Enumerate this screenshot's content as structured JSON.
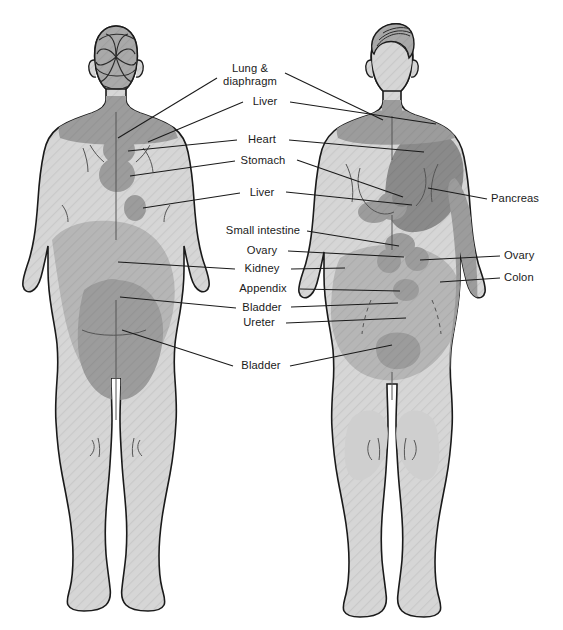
{
  "figure": {
    "views": [
      {
        "name": "posterior",
        "caption": "Posterior (back) view"
      },
      {
        "name": "anterior",
        "caption": "Anterior (front) view"
      }
    ],
    "colors": {
      "background": "#ffffff",
      "body_fill": "#d6d6d6",
      "body_outline": "#1a1a1a",
      "zone_mid": "#b3b3b3",
      "zone_dark": "#9a9a9a",
      "zone_darkest": "#868686",
      "hair_fill": "#a8a8a8",
      "label_text": "#1a1a1a",
      "leader_line": "#1a1a1a"
    }
  },
  "labels": {
    "center_column": [
      {
        "id": "lung-diaphragm",
        "text_line1": "Lung &",
        "text_line2": "diaphragm",
        "x": 250,
        "y": 68,
        "align": "center"
      },
      {
        "id": "liver-upper",
        "text": "Liver",
        "x": 265,
        "y": 101,
        "align": "center"
      },
      {
        "id": "heart",
        "text": "Heart",
        "x": 262,
        "y": 139,
        "align": "center"
      },
      {
        "id": "stomach",
        "text": "Stomach",
        "x": 262,
        "y": 160,
        "align": "center"
      },
      {
        "id": "liver-lower",
        "text": "Liver",
        "x": 262,
        "y": 192,
        "align": "center"
      },
      {
        "id": "small-intestine",
        "text": "Small intestine",
        "x": 262,
        "y": 230,
        "align": "center"
      },
      {
        "id": "ovary-left",
        "text": "Ovary",
        "x": 262,
        "y": 250,
        "align": "center"
      },
      {
        "id": "kidney",
        "text": "Kidney",
        "x": 262,
        "y": 268,
        "align": "center"
      },
      {
        "id": "appendix",
        "text": "Appendix",
        "x": 262,
        "y": 288,
        "align": "center"
      },
      {
        "id": "bladder-upper",
        "text": "Bladder",
        "x": 262,
        "y": 307,
        "align": "center"
      },
      {
        "id": "ureter",
        "text": "Ureter",
        "x": 262,
        "y": 322,
        "align": "center"
      },
      {
        "id": "bladder-lower",
        "text": "Bladder",
        "x": 262,
        "y": 365,
        "align": "center"
      }
    ],
    "right_column": [
      {
        "id": "pancreas",
        "text": "Pancreas",
        "x": 492,
        "y": 198,
        "align": "left"
      },
      {
        "id": "ovary-right",
        "text": "Ovary",
        "x": 505,
        "y": 255,
        "align": "left"
      },
      {
        "id": "colon",
        "text": "Colon",
        "x": 505,
        "y": 277,
        "align": "left"
      }
    ]
  },
  "organ_zones": {
    "posterior": [
      {
        "organ": "lung-diaphragm",
        "region": "upper-shoulders-neck",
        "shade": "zone_dark"
      },
      {
        "organ": "liver",
        "region": "right-upper-back",
        "shade": "zone_dark"
      },
      {
        "organ": "heart",
        "region": "left-scapular",
        "shade": "zone_dark"
      },
      {
        "organ": "stomach",
        "region": "mid-thoracic",
        "shade": "zone_dark"
      },
      {
        "organ": "liver",
        "region": "lower-right-thoracic",
        "shade": "zone_dark"
      },
      {
        "organ": "kidney",
        "region": "flank-lumbar-broad",
        "shade": "zone_mid"
      },
      {
        "organ": "bladder",
        "region": "sacral",
        "shade": "zone_dark"
      },
      {
        "organ": "bladder",
        "region": "perineal-gluteal",
        "shade": "zone_dark"
      }
    ],
    "anterior": [
      {
        "organ": "lung-diaphragm",
        "region": "supraclavicular-neck",
        "shade": "zone_dark"
      },
      {
        "organ": "pancreas",
        "region": "left-chest-upper-abdomen",
        "shade": "zone_darkest"
      },
      {
        "organ": "pancreas",
        "region": "left-arm-medial-stripe",
        "shade": "zone_dark"
      },
      {
        "organ": "liver",
        "region": "right-upper-quadrant",
        "shade": "zone_dark"
      },
      {
        "organ": "small-intestine",
        "region": "periumbilical",
        "shade": "zone_dark"
      },
      {
        "organ": "ovary",
        "region": "left-lower-quadrant",
        "shade": "zone_dark"
      },
      {
        "organ": "ovary",
        "region": "right-lower-quadrant",
        "shade": "zone_dark"
      },
      {
        "organ": "colon",
        "region": "lower-abdomen-broad",
        "shade": "zone_mid"
      },
      {
        "organ": "appendix",
        "region": "right-iliac-fossa",
        "shade": "zone_dark"
      },
      {
        "organ": "ureter",
        "region": "groin-inguinal",
        "shade": "zone_mid"
      },
      {
        "organ": "bladder",
        "region": "suprapubic",
        "shade": "zone_dark"
      }
    ]
  }
}
